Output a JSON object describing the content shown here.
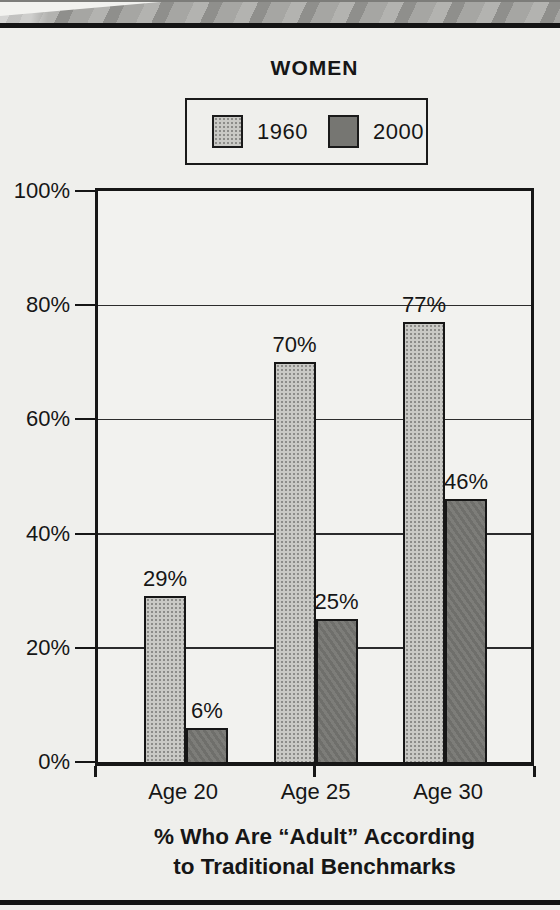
{
  "title": "WOMEN",
  "legend": {
    "items": [
      {
        "label": "1960",
        "swatch": "light-halftone-gray",
        "color": "#b9b9b6"
      },
      {
        "label": "2000",
        "swatch": "dark-gray",
        "color": "#767672"
      }
    ]
  },
  "chart_data": {
    "type": "bar",
    "title": "WOMEN",
    "categories": [
      "Age 20",
      "Age 25",
      "Age 30"
    ],
    "series": [
      {
        "name": "1960",
        "values": [
          29,
          70,
          77
        ]
      },
      {
        "name": "2000",
        "values": [
          6,
          25,
          46
        ]
      }
    ],
    "data_labels": [
      [
        "29%",
        "70%",
        "77%"
      ],
      [
        "6%",
        "25%",
        "46%"
      ]
    ],
    "xlabel": "% Who Are “Adult” According to Traditional Benchmarks",
    "ylabel": "",
    "ylim": [
      0,
      100
    ],
    "y_ticks": [
      "0%",
      "20%",
      "40%",
      "60%",
      "80%",
      "100%"
    ],
    "y_tick_values": [
      0,
      20,
      40,
      60,
      80,
      100
    ],
    "grid": true,
    "legend_position": "top",
    "bar_colors": {
      "1960": "#b9b9b6",
      "2000": "#767672"
    }
  },
  "caption": {
    "line1": "% Who Are “Adult” According",
    "line2": "to Traditional Benchmarks"
  },
  "colors": {
    "page_background": "#efefec",
    "plot_background": "#f2f2ef",
    "ink": "#161616",
    "photo_band": "#9e9e9b"
  }
}
